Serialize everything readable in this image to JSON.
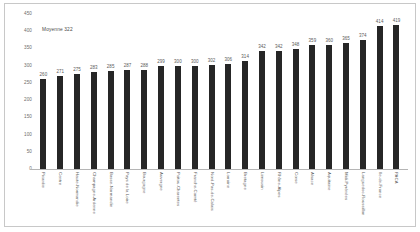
{
  "chart_data": {
    "type": "bar",
    "title": "",
    "xlabel": "",
    "ylabel": "",
    "ylim": [
      0,
      450
    ],
    "yticks": [
      0,
      50,
      100,
      150,
      200,
      250,
      300,
      350,
      400,
      450
    ],
    "grid": false,
    "legend": "none",
    "bar_color": "#262626",
    "annotations": [
      {
        "name": "mean-annotation",
        "text": "Moyenne  322",
        "value": 322
      }
    ],
    "categories": [
      "Picardie",
      "Centre",
      "Haute-Normandie",
      "Champagne-Ardenne",
      "Basse-Normandie",
      "Pays de la Loire",
      "Bourgogne",
      "Auvergne",
      "Poitou-Charentes",
      "Franche-Comté",
      "Nord-Pas-de-Calais",
      "Lorraine",
      "Bretagne",
      "Limousin",
      "Rhône-Alpes",
      "Corse",
      "Alsace",
      "Aquitaine",
      "Midi-Pyrénées",
      "Languedoc-Roussillon",
      "Ile-de-France",
      "PACA"
    ],
    "values": [
      260,
      271,
      275,
      283,
      285,
      287,
      288,
      299,
      300,
      300,
      302,
      306,
      314,
      342,
      342,
      348,
      359,
      360,
      365,
      374,
      414,
      419
    ]
  }
}
